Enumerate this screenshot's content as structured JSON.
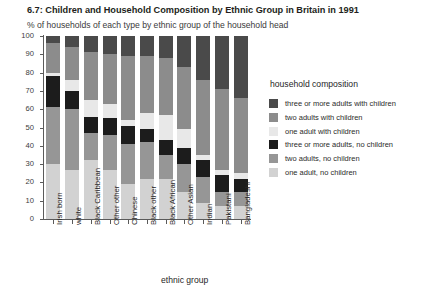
{
  "header": {
    "title": "6.7: Children and Household Composition by Ethnic Group in Britain in 1991",
    "subtitle": "% of households of each type by ethnic group of the household head"
  },
  "legend": {
    "title": "household composition",
    "items": [
      {
        "label": "three or more adults with children",
        "color": "#4a4a4a"
      },
      {
        "label": "two adults with children",
        "color": "#8c8c8c"
      },
      {
        "label": "one adult with children",
        "color": "#e8e8e8"
      },
      {
        "label": "three or more adults, no children",
        "color": "#1c1c1c"
      },
      {
        "label": "two adults, no children",
        "color": "#969696"
      },
      {
        "label": "one adult, no children",
        "color": "#d2d2d2"
      }
    ]
  },
  "axes": {
    "x_title": "ethnic group",
    "y_ticks": [
      "100",
      "90",
      "80",
      "70",
      "60",
      "50",
      "40",
      "30",
      "20",
      "10",
      "0"
    ]
  },
  "chart_data": {
    "type": "bar",
    "subtype": "stacked-100-percent",
    "title": "6.7: Children and Household Composition by Ethnic Group in Britain in 1991",
    "subtitle": "% of households of each type by ethnic group of the household head",
    "xlabel": "ethnic group",
    "ylabel": "",
    "ylim": [
      0,
      100
    ],
    "ytick_step": 10,
    "grid": false,
    "legend_position": "right",
    "legend_title": "household composition",
    "categories": [
      "Irish born",
      "white",
      "Black Caribbean",
      "Other other",
      "Chinese",
      "Black other",
      "Black African",
      "Other Asian",
      "Indian",
      "Pakistani",
      "Bangladeshi"
    ],
    "series": [
      {
        "name": "one adult, no children",
        "color": "#d2d2d2",
        "values": [
          30,
          27,
          32,
          27,
          19,
          22,
          22,
          15,
          9,
          7,
          7
        ]
      },
      {
        "name": "two adults, no children",
        "color": "#969696",
        "values": [
          31,
          33,
          15,
          19,
          22,
          20,
          13,
          15,
          14,
          8,
          8
        ]
      },
      {
        "name": "three or more adults, no children",
        "color": "#1c1c1c",
        "values": [
          17,
          10,
          9,
          9,
          10,
          7,
          8,
          9,
          9,
          9,
          7
        ]
      },
      {
        "name": "one adult with children",
        "color": "#e8e8e8",
        "values": [
          2,
          6,
          9,
          8,
          3,
          9,
          14,
          10,
          3,
          3,
          3
        ]
      },
      {
        "name": "two adults with children",
        "color": "#8c8c8c",
        "values": [
          16,
          18,
          26,
          27,
          35,
          31,
          31,
          34,
          41,
          44,
          41
        ]
      },
      {
        "name": "three or more adults with children",
        "color": "#4a4a4a",
        "values": [
          4,
          6,
          9,
          10,
          11,
          11,
          12,
          17,
          24,
          29,
          34
        ]
      }
    ]
  }
}
